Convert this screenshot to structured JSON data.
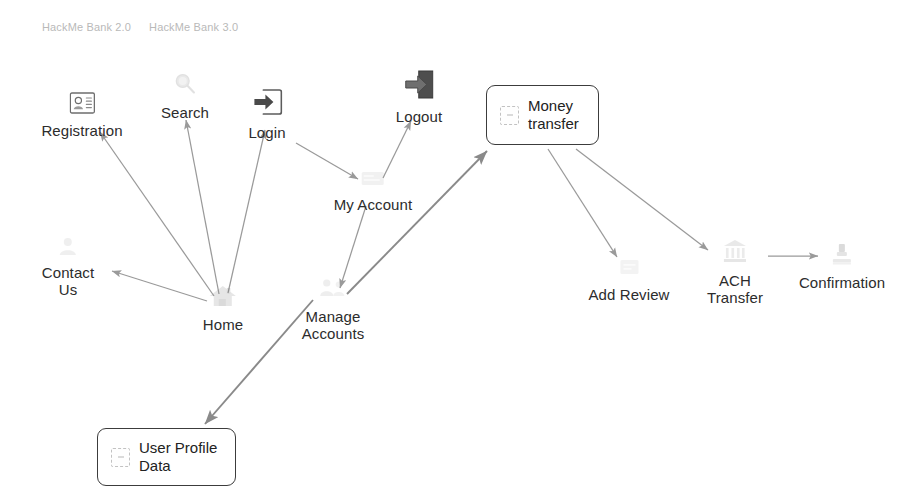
{
  "page": {
    "background": "#ffffff",
    "arrow_color": "#9a9a9a",
    "text_color": "#2c2c2c",
    "box_border_color": "#3c3c3c"
  },
  "header": {
    "tabs": [
      {
        "label": "HackMe Bank 2.0"
      },
      {
        "label": "HackMe Bank 3.0"
      }
    ]
  },
  "diagram": {
    "type": "flow-sitemap",
    "nodes": [
      {
        "id": "registration",
        "label": "Registration",
        "icon": "id-card-icon",
        "shape": "icon-label",
        "x": 82,
        "y": 110
      },
      {
        "id": "search",
        "label": "Search",
        "icon": "magnifier-icon",
        "shape": "icon-label",
        "x": 185,
        "y": 98
      },
      {
        "id": "login",
        "label": "Login",
        "icon": "login-arrow-icon",
        "shape": "icon-label",
        "x": 267,
        "y": 110
      },
      {
        "id": "logout",
        "label": "Logout",
        "icon": "logout-arrow-icon",
        "shape": "icon-label",
        "x": 419,
        "y": 98
      },
      {
        "id": "money_transfer",
        "label": "Money\ntransfer",
        "icon": "broken-image-icon",
        "shape": "rounded-box",
        "x": 542,
        "y": 115
      },
      {
        "id": "my_account",
        "label": "My Account",
        "icon": "faded-icon",
        "shape": "icon-label",
        "x": 373,
        "y": 190
      },
      {
        "id": "contact_us",
        "label": "Contact\nUs",
        "icon": "faded-person-icon",
        "shape": "icon-label",
        "x": 68,
        "y": 255
      },
      {
        "id": "home",
        "label": "Home",
        "icon": "faded-house-icon",
        "shape": "icon-label",
        "x": 223,
        "y": 305
      },
      {
        "id": "manage_accounts",
        "label": "Manage\nAccounts",
        "icon": "faded-people-icon",
        "shape": "icon-label",
        "x": 333,
        "y": 310
      },
      {
        "id": "add_review",
        "label": "Add Review",
        "icon": "faded-icon",
        "shape": "icon-label",
        "x": 629,
        "y": 280
      },
      {
        "id": "ach_transfer",
        "label": "ACH\nTransfer",
        "icon": "faded-bank-icon",
        "shape": "icon-label",
        "x": 735,
        "y": 282
      },
      {
        "id": "confirmation",
        "label": "Confirmation",
        "icon": "faded-seal-icon",
        "shape": "icon-label",
        "x": 842,
        "y": 272
      },
      {
        "id": "user_profile",
        "label": "User Profile\nData",
        "icon": "broken-image-icon",
        "shape": "rounded-box",
        "x": 160,
        "y": 458
      }
    ],
    "edges": [
      {
        "from": "home",
        "to": "registration"
      },
      {
        "from": "home",
        "to": "search"
      },
      {
        "from": "home",
        "to": "login"
      },
      {
        "from": "home",
        "to": "contact_us"
      },
      {
        "from": "login",
        "to": "my_account"
      },
      {
        "from": "my_account",
        "to": "logout"
      },
      {
        "from": "my_account",
        "to": "manage_accounts"
      },
      {
        "from": "manage_accounts",
        "to": "money_transfer"
      },
      {
        "from": "manage_accounts",
        "to": "user_profile"
      },
      {
        "from": "money_transfer",
        "to": "add_review"
      },
      {
        "from": "money_transfer",
        "to": "ach_transfer"
      },
      {
        "from": "ach_transfer",
        "to": "confirmation"
      }
    ]
  }
}
